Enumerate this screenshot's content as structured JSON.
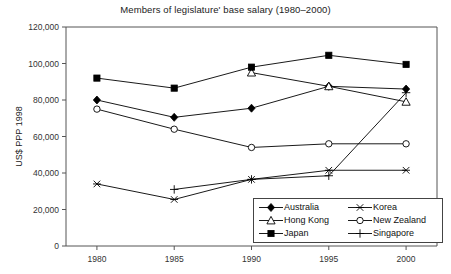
{
  "chart_data": {
    "type": "line",
    "title": "Members of legislature' base salary (1980–2000)",
    "xlabel": "",
    "ylabel": "US$ PPP 1998",
    "x": [
      1980,
      1985,
      1990,
      1995,
      2000
    ],
    "xtick_labels": [
      "1980",
      "1985",
      "1990",
      "1995",
      "2000"
    ],
    "ytick_labels": [
      "0",
      "20,000",
      "40,000",
      "60,000",
      "80,000",
      "100,000",
      "120,000"
    ],
    "ytick_values": [
      0,
      20000,
      40000,
      60000,
      80000,
      100000,
      120000
    ],
    "xlim": [
      1978,
      2002
    ],
    "ylim": [
      0,
      120000
    ],
    "grid": false,
    "legend_position": "inside-bottom-right",
    "series": [
      {
        "name": "Australia",
        "marker": "filled-diamond",
        "x": [
          1980,
          1985,
          1990,
          1995,
          2000
        ],
        "values": [
          80000,
          70500,
          75500,
          87500,
          86000
        ]
      },
      {
        "name": "Hong Kong",
        "marker": "open-triangle",
        "x": [
          1990,
          1995,
          2000
        ],
        "values": [
          95000,
          87500,
          79000
        ]
      },
      {
        "name": "Japan",
        "marker": "filled-square",
        "x": [
          1980,
          1985,
          1990,
          1995,
          2000
        ],
        "values": [
          92000,
          86500,
          98000,
          104500,
          99500
        ]
      },
      {
        "name": "Korea",
        "marker": "asterisk",
        "x": [
          1980,
          1985,
          1990,
          1995,
          2000
        ],
        "values": [
          34000,
          25500,
          36500,
          41500,
          41500
        ]
      },
      {
        "name": "New Zealand",
        "marker": "open-circle",
        "x": [
          1980,
          1985,
          1990,
          1995,
          2000
        ],
        "values": [
          75000,
          64000,
          54000,
          56000,
          56000
        ]
      },
      {
        "name": "Singapore",
        "marker": "plus",
        "x": [
          1985,
          1990,
          1995,
          2000
        ],
        "values": [
          31000,
          36500,
          38500,
          84000
        ]
      }
    ]
  },
  "legend": {
    "entries": [
      {
        "label": "Australia",
        "marker": "filled-diamond",
        "col": 0
      },
      {
        "label": "Korea",
        "marker": "asterisk",
        "col": 1
      },
      {
        "label": "Hong Kong",
        "marker": "open-triangle",
        "col": 0
      },
      {
        "label": "New Zealand",
        "marker": "open-circle",
        "col": 1
      },
      {
        "label": "Japan",
        "marker": "filled-square",
        "col": 0
      },
      {
        "label": "Singapore",
        "marker": "plus",
        "col": 1
      }
    ]
  },
  "colors": {
    "ink": "#000000",
    "axis": "#555555",
    "background": "#ffffff"
  }
}
